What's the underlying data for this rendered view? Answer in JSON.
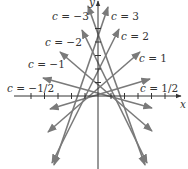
{
  "diagram": {
    "title": "",
    "axes": {
      "x_label": "x",
      "y_label": "y",
      "origin_px": [
        98,
        96
      ],
      "tick_spacing_px": 13.5,
      "x_ticks_px": [
        31,
        44.5,
        58,
        71.5,
        85,
        111,
        124.5,
        138,
        151.5,
        165
      ],
      "y_ticks_px": [
        82.5,
        69,
        55.5,
        42,
        28.5
      ]
    },
    "line_color": "#7a7a7a",
    "axis_color": "#333333",
    "lines": [
      {
        "c": "-3",
        "label": "c = −3",
        "p1": [
          88,
          6
        ],
        "p2": [
          145,
          165
        ],
        "label_pos": [
          52,
          11
        ]
      },
      {
        "c": "3",
        "label": "c = 3",
        "p1": [
          108,
          7
        ],
        "p2": [
          54,
          165
        ],
        "label_pos": [
          111,
          11
        ]
      },
      {
        "c": "-2",
        "label": "c = −2",
        "p1": [
          82,
          30
        ],
        "p2": [
          147,
          163
        ],
        "label_pos": [
          45,
          37
        ]
      },
      {
        "c": "2",
        "label": "c = 2",
        "p1": [
          119,
          29
        ],
        "p2": [
          52,
          163
        ],
        "label_pos": [
          121,
          31
        ]
      },
      {
        "c": "-1",
        "label": "c = −1",
        "p1": [
          60,
          52
        ],
        "p2": [
          152,
          131
        ],
        "label_pos": [
          28,
          59
        ]
      },
      {
        "c": "1",
        "label": "c = 1",
        "p1": [
          140,
          52
        ],
        "p2": [
          48,
          132
        ],
        "label_pos": [
          139,
          53
        ]
      },
      {
        "c": "-1/2",
        "label": "c = −1/2",
        "p1": [
          43,
          78
        ],
        "p2": [
          152,
          108
        ],
        "label_pos": [
          7,
          83
        ]
      },
      {
        "c": "1/2",
        "label": "c = 1/2",
        "p1": [
          150,
          79
        ],
        "p2": [
          50,
          109
        ],
        "label_pos": [
          140,
          83
        ]
      }
    ]
  }
}
